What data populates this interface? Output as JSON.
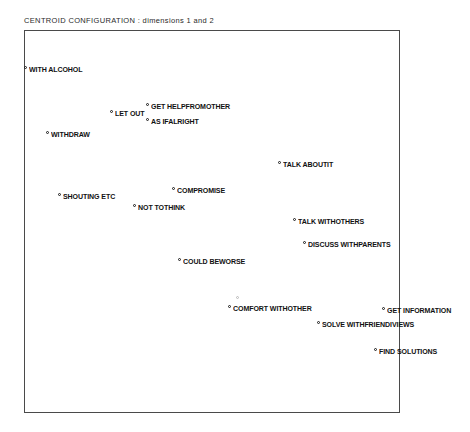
{
  "chart_data": {
    "type": "scatter",
    "title": "CENTROID CONFIGURATION :  dimensions 1 and 2",
    "xlabel": "",
    "ylabel": "",
    "grid": false,
    "legend": "none",
    "axis_ticks_shown": false,
    "xlim": [
      -2.0,
      2.0
    ],
    "ylim": [
      -2.0,
      2.0
    ],
    "note": "Multidimensional scaling centroid plot; points labelled with coping-strategy category names. Axis tick values are not printed on the figure, so x/y are read off as relative plot-box fractions.",
    "points": [
      {
        "label": "WITH ALCOHOL",
        "x": 0.0,
        "y": 0.895,
        "px": 24,
        "py": 70,
        "ghost": false
      },
      {
        "label": "GET HELPFROMOTHER",
        "x": 0.325,
        "y": 0.798,
        "px": 146,
        "py": 107,
        "ghost": false
      },
      {
        "label": "LET OUT",
        "x": 0.229,
        "y": 0.78,
        "px": 110,
        "py": 114,
        "ghost": false
      },
      {
        "label": "AS IFALRIGHT",
        "x": 0.325,
        "y": 0.759,
        "px": 146,
        "py": 122,
        "ghost": false
      },
      {
        "label": "WITHDRAW",
        "x": 0.059,
        "y": 0.725,
        "px": 46,
        "py": 135,
        "ghost": false
      },
      {
        "label": "TALK ABOUTIT",
        "x": 0.676,
        "y": 0.647,
        "px": 278,
        "py": 165,
        "ghost": false
      },
      {
        "label": "COMPROMISE",
        "x": 0.394,
        "y": 0.579,
        "px": 172,
        "py": 191,
        "ghost": false
      },
      {
        "label": "SHOUTING ETC",
        "x": 0.09,
        "y": 0.564,
        "px": 58,
        "py": 197,
        "ghost": false
      },
      {
        "label": "NOT TOTHINK",
        "x": 0.29,
        "y": 0.535,
        "px": 133,
        "py": 208,
        "ghost": false
      },
      {
        "label": "TALK WITHOTHERS",
        "x": 0.715,
        "y": 0.499,
        "px": 293,
        "py": 222,
        "ghost": false
      },
      {
        "label": "DISCUSS WITHPARENTS",
        "x": 0.742,
        "y": 0.439,
        "px": 303,
        "py": 245,
        "ghost": false
      },
      {
        "label": "COULD BEWORSE",
        "x": 0.41,
        "y": 0.394,
        "px": 178,
        "py": 262,
        "ghost": false
      },
      {
        "label": "COMFORT WITHOTHER",
        "x": 0.542,
        "y": 0.27,
        "px": 228,
        "py": 309,
        "ghost": false
      },
      {
        "label": "GET INFORMATION",
        "x": 0.952,
        "y": 0.266,
        "px": 382,
        "py": 311,
        "ghost": false
      },
      {
        "label": "SOLVE WITHFRIENDIVIEWS",
        "x": 0.779,
        "y": 0.23,
        "px": 317,
        "py": 325,
        "ghost": false
      },
      {
        "label": "FIND SOLUTIONS",
        "x": 0.931,
        "y": 0.159,
        "px": 374,
        "py": 352,
        "ghost": false
      }
    ],
    "obscured_points": [
      {
        "label": "",
        "px": 236,
        "py": 300,
        "ghost": true,
        "note": "overprinted illegible label above COMFORT WITHOTHER"
      }
    ]
  }
}
